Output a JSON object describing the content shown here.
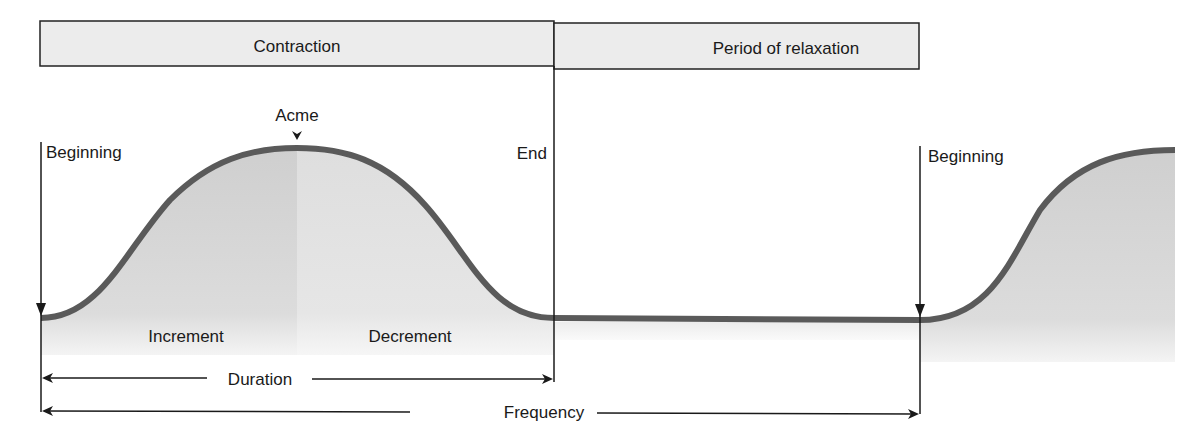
{
  "header": {
    "contraction_label": "Contraction",
    "relaxation_label": "Period of relaxation"
  },
  "labels": {
    "acme": "Acme",
    "beginning_1": "Beginning",
    "end": "End",
    "beginning_2": "Beginning",
    "increment": "Increment",
    "decrement": "Decrement",
    "duration": "Duration",
    "frequency": "Frequency"
  },
  "colors": {
    "curve": "#5a5a5a",
    "fill_increment": "#d4d4d4",
    "fill_decrement": "#e2e2e2",
    "header_bg": "#ececec",
    "line": "#1a1a1a"
  }
}
